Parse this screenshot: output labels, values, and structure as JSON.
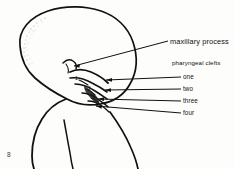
{
  "figure": {
    "number": "8",
    "background_color": "#fdfdfb",
    "ink_color": "#111111"
  },
  "labels": {
    "maxillary_process": "maxillary process",
    "pharyngeal_clefts_heading": "pharyngeal clefts",
    "clefts": [
      {
        "label": "one"
      },
      {
        "label": "two"
      },
      {
        "label": "three"
      },
      {
        "label": "four"
      }
    ]
  },
  "arch_numbers": [
    {
      "label": "1"
    },
    {
      "label": "2"
    },
    {
      "label": "3"
    },
    {
      "label": "4"
    }
  ]
}
